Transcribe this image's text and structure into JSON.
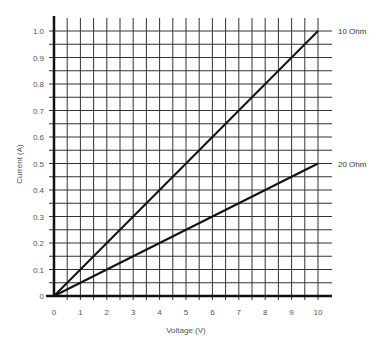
{
  "chart_data": {
    "type": "line",
    "title": "",
    "xlabel": "Voltage (V)",
    "ylabel": "Current (A)",
    "xlim": [
      0,
      10
    ],
    "ylim": [
      0,
      1.0
    ],
    "grid": true,
    "legend_position": "inline-right",
    "x_ticks": [
      "0",
      "1",
      "2",
      "3",
      "4",
      "5",
      "6",
      "7",
      "8",
      "9",
      "10"
    ],
    "y_ticks": [
      "0",
      "0.1",
      "0.2",
      "0.3",
      "0.4",
      "0.5",
      "0.6",
      "0.7",
      "0.8",
      "0.9",
      "1.0"
    ],
    "x": [
      0,
      10
    ],
    "series": [
      {
        "name": "10 Ohm",
        "values": [
          0,
          1.0
        ]
      },
      {
        "name": "20 Ohm",
        "values": [
          0,
          0.5
        ]
      }
    ],
    "colors": {
      "grid": "#333333",
      "axis": "#111111",
      "line": "#111111",
      "text": "#555555"
    }
  }
}
